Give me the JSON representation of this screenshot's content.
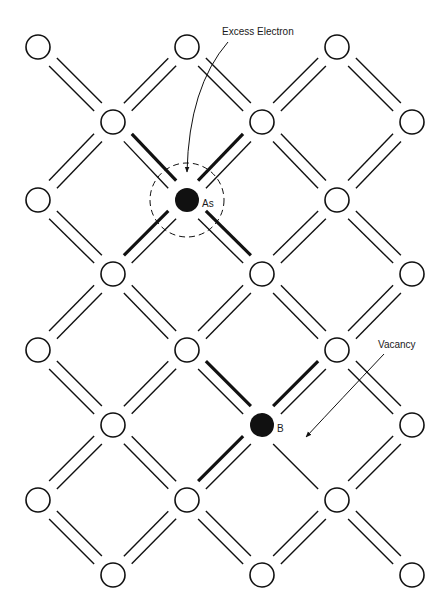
{
  "figure": {
    "colors": {
      "background": "#ffffff",
      "ink": "#111111"
    },
    "labels": {
      "excess_electron": "Excess Electron",
      "vacancy": "Vacancy",
      "as_atom": "As",
      "b_atom": "B"
    },
    "lattice": {
      "even_rows": {
        "x": [
          38,
          187,
          337
        ],
        "y": [
          47,
          200,
          350,
          500
        ]
      },
      "odd_rows": {
        "x": [
          113,
          262,
          412
        ],
        "y": [
          122,
          274,
          425,
          575
        ]
      },
      "atom_radius": 12,
      "dopant_radius": 12,
      "dopants": [
        {
          "name": "As",
          "x": 187,
          "y": 200,
          "type": "donor",
          "bond_style": "all-thick-outer"
        },
        {
          "name": "B",
          "x": 262,
          "y": 425,
          "type": "acceptor",
          "missing_bond_to": [
            337,
            500
          ]
        }
      ]
    },
    "annotations": {
      "excess_electron": {
        "text_x": 222,
        "text_y": 35,
        "arrow_from": [
          228,
          42
        ],
        "arrow_to": [
          187,
          172
        ]
      },
      "vacancy": {
        "text_x": 378,
        "text_y": 348,
        "arrow_from": [
          384,
          354
        ],
        "arrow_to": [
          306,
          437
        ]
      },
      "as_dashed_circle": {
        "cx": 187,
        "cy": 200,
        "r": 37
      }
    }
  }
}
